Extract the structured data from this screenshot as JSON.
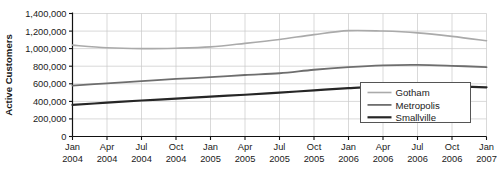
{
  "chart_data": {
    "type": "line",
    "title": "",
    "xlabel": "",
    "ylabel": "Active Customers",
    "ylim": [
      0,
      1400000
    ],
    "ytick_values": [
      0,
      200000,
      400000,
      600000,
      800000,
      1000000,
      1200000,
      1400000
    ],
    "ytick_labels": [
      "0",
      "200,000",
      "400,000",
      "600,000",
      "800,000",
      "1,000,000",
      "1,200,000",
      "1,400,000"
    ],
    "grid": true,
    "legend_position": "lower-right",
    "categories": [
      "Jan 2004",
      "Apr 2004",
      "Jul 2004",
      "Oct 2004",
      "Jan 2005",
      "Apr 2005",
      "Jul 2005",
      "Oct 2005",
      "Jan 2006",
      "Apr 2006",
      "Jul 2006",
      "Oct 2006",
      "Jan 2007"
    ],
    "xtick_month_labels": [
      "Jan",
      "Apr",
      "Jul",
      "Oct",
      "Jan",
      "Apr",
      "Jul",
      "Oct",
      "Jan",
      "Apr",
      "Jul",
      "Oct",
      "Jan"
    ],
    "xtick_year_labels": [
      "2004",
      "2004",
      "2004",
      "2004",
      "2005",
      "2005",
      "2005",
      "2005",
      "2006",
      "2006",
      "2006",
      "2006",
      "2007"
    ],
    "series": [
      {
        "name": "Gotham",
        "color": "#aaaaaa",
        "width": 1.6,
        "values": [
          1040000,
          1010000,
          1000000,
          1005000,
          1020000,
          1060000,
          1105000,
          1160000,
          1205000,
          1200000,
          1180000,
          1140000,
          1090000
        ]
      },
      {
        "name": "Metropolis",
        "color": "#6e6e6e",
        "width": 1.8,
        "values": [
          580000,
          605000,
          630000,
          655000,
          675000,
          700000,
          720000,
          760000,
          790000,
          810000,
          815000,
          805000,
          790000
        ]
      },
      {
        "name": "Smallville",
        "color": "#262626",
        "width": 2.2,
        "values": [
          360000,
          385000,
          410000,
          430000,
          455000,
          475000,
          500000,
          525000,
          550000,
          570000,
          575000,
          570000,
          560000
        ]
      }
    ]
  },
  "legend": {
    "items": [
      {
        "label": "Gotham"
      },
      {
        "label": "Metropolis"
      },
      {
        "label": "Smallville"
      }
    ]
  },
  "caption": {
    "text": ""
  }
}
